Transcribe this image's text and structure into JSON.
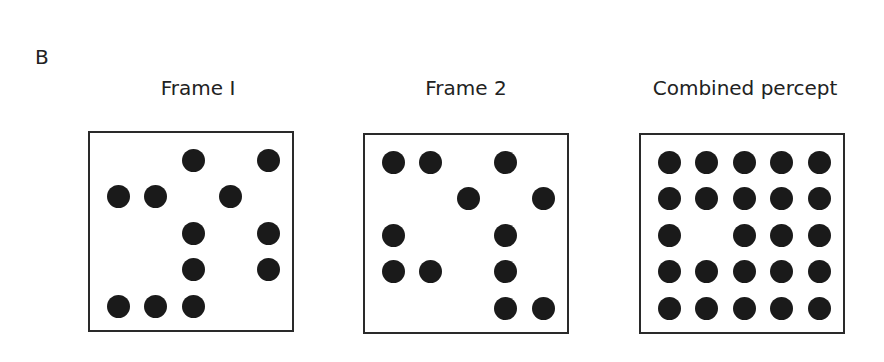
{
  "panel_label": "B",
  "grid": {
    "cols": 5,
    "rows": 5,
    "origin_x": 30,
    "origin_y": 29,
    "step_x": 37.5,
    "step_y": 36.5,
    "dot_diameter": 23
  },
  "frames": [
    {
      "id": "frame-1",
      "title": "Frame I",
      "left": 88,
      "top": 131,
      "title_center_x": 198,
      "dots": [
        [
          0,
          0,
          1,
          0,
          1
        ],
        [
          1,
          1,
          0,
          1,
          0
        ],
        [
          0,
          0,
          1,
          0,
          1
        ],
        [
          0,
          0,
          1,
          0,
          1
        ],
        [
          1,
          1,
          1,
          0,
          0
        ]
      ]
    },
    {
      "id": "frame-2",
      "title": "Frame 2",
      "left": 363,
      "top": 133,
      "title_center_x": 466,
      "dots": [
        [
          1,
          1,
          0,
          1,
          0
        ],
        [
          0,
          0,
          1,
          0,
          1
        ],
        [
          1,
          0,
          0,
          1,
          0
        ],
        [
          1,
          1,
          0,
          1,
          0
        ],
        [
          0,
          0,
          0,
          1,
          1
        ]
      ]
    },
    {
      "id": "combined-percept",
      "title": "Combined percept",
      "left": 639,
      "top": 133,
      "title_center_x": 745,
      "dots": [
        [
          1,
          1,
          1,
          1,
          1
        ],
        [
          1,
          1,
          1,
          1,
          1
        ],
        [
          1,
          0,
          1,
          1,
          1
        ],
        [
          1,
          1,
          1,
          1,
          1
        ],
        [
          1,
          1,
          1,
          1,
          1
        ]
      ]
    }
  ],
  "colors": {
    "dot": "#1a1a1a",
    "border": "#2a2a2a",
    "background": "#ffffff"
  }
}
